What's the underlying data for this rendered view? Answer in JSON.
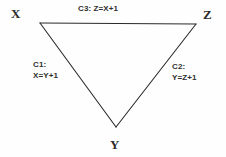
{
  "figure": {
    "type": "constraint-graph",
    "background_color": "#fefefe",
    "stroke_color": "#2b2b2b",
    "text_color": "#2e2e2e"
  },
  "nodes": [
    {
      "id": "X",
      "label": "X",
      "x": 40,
      "y": 23
    },
    {
      "id": "Z",
      "label": "Z",
      "x": 196,
      "y": 24
    },
    {
      "id": "Y",
      "label": "Y",
      "x": 116,
      "y": 127
    }
  ],
  "edges": [
    {
      "id": "C3",
      "name": "C3:",
      "constraint": "Z=X+1",
      "full": "C3: Z=X+1",
      "from": "X",
      "to": "Z",
      "layout": "inline"
    },
    {
      "id": "C1",
      "name": "C1:",
      "constraint": "X=Y+1",
      "full": "C1: X=Y+1",
      "from": "X",
      "to": "Y",
      "layout": "stacked"
    },
    {
      "id": "C2",
      "name": "C2:",
      "constraint": "Y=Z+1",
      "full": "C2: Y=Z+1",
      "from": "Y",
      "to": "Z",
      "layout": "stacked"
    }
  ]
}
